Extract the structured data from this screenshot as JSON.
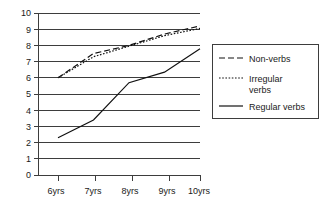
{
  "chart_data": {
    "type": "line",
    "title": "",
    "xlabel": "",
    "ylabel": "",
    "categories": [
      "6yrs",
      "7yrs",
      "8yrs",
      "9yrs",
      "10yrs"
    ],
    "ylim": [
      0,
      10
    ],
    "yticks": [
      0,
      1,
      2,
      3,
      4,
      5,
      6,
      7,
      8,
      9,
      10
    ],
    "ytick_labels": [
      "0",
      "1",
      "2",
      "3",
      "4",
      "5",
      "6",
      "7",
      "8",
      "9",
      "10"
    ],
    "grid": true,
    "grid_axis": "y",
    "legend_position": "right",
    "series": [
      {
        "name": "Non-verbs",
        "style": "dashed",
        "dash_pattern": "6,3",
        "color": "#111111",
        "values": [
          6.0,
          7.5,
          8.0,
          8.7,
          9.2
        ]
      },
      {
        "name": "Irregular verbs",
        "style": "dotted",
        "dash_pattern": "1.6,1.6",
        "color": "#111111",
        "values": [
          6.0,
          7.3,
          7.95,
          8.6,
          9.05
        ]
      },
      {
        "name": "Regular verbs",
        "style": "solid",
        "dash_pattern": "none",
        "color": "#111111",
        "values": [
          2.3,
          3.4,
          5.7,
          6.35,
          7.8
        ]
      }
    ]
  },
  "legend": {
    "entries": [
      {
        "label": "Non-verbs"
      },
      {
        "label": "Irregular",
        "label_line2": "verbs"
      },
      {
        "label": "Regular verbs"
      }
    ]
  },
  "axes": {
    "y_tick_0": "0",
    "y_tick_1": "1",
    "y_tick_2": "2",
    "y_tick_3": "3",
    "y_tick_4": "4",
    "y_tick_5": "5",
    "y_tick_6": "6",
    "y_tick_7": "7",
    "y_tick_8": "8",
    "y_tick_9": "9",
    "y_tick_10": "10",
    "x_tick_0": "6yrs",
    "x_tick_1": "7yrs",
    "x_tick_2": "8yrs",
    "x_tick_3": "9yrs",
    "x_tick_4": "10yrs"
  }
}
